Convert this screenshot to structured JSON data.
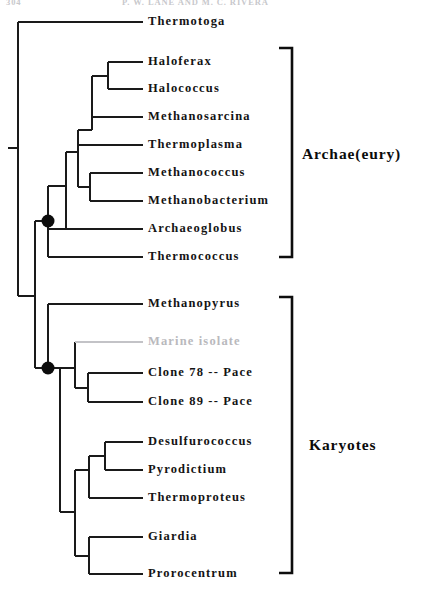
{
  "header": {
    "folio": "304",
    "running_head": "P. W. LANE AND M. C. RIVERA"
  },
  "figure": {
    "type": "phylogenetic-tree",
    "orientation": "left-to-right-cladogram",
    "line_color": "#1a1a1a",
    "text_color": "#141414",
    "faded_color": "#b9b9bd",
    "background": "#ffffff"
  },
  "groups": [
    {
      "id": "archae-eury",
      "label": "Archae(eury)",
      "bracket_top_y": 48,
      "bracket_bottom_y": 257,
      "members": [
        "Haloferax",
        "Halococcus",
        "Methanosarcina",
        "Thermoplasma",
        "Methanococcus",
        "Methanobacterium",
        "Archaeoglobus",
        "Thermococcus"
      ]
    },
    {
      "id": "karyotes",
      "label": "Karyotes",
      "bracket_top_y": 297,
      "bracket_bottom_y": 573,
      "members": [
        "Methanopyrus",
        "Marine isolate",
        "Clone 78 -- Pace",
        "Clone 89 -- Pace",
        "Desulfurococcus",
        "Pyrodictium",
        "Thermoproteus",
        "Giardia",
        "Prorocentrum"
      ]
    }
  ],
  "taxa": [
    {
      "id": "thermotoga",
      "label": "Thermotoga",
      "y": 22,
      "tip_x": 143,
      "faded": false,
      "group": null
    },
    {
      "id": "haloferax",
      "label": "Haloferax",
      "y": 62,
      "tip_x": 143,
      "faded": false,
      "group": "archae-eury"
    },
    {
      "id": "halococcus",
      "label": "Halococcus",
      "y": 89,
      "tip_x": 143,
      "faded": false,
      "group": "archae-eury"
    },
    {
      "id": "methanosarcina",
      "label": "Methanosarcina",
      "y": 117,
      "tip_x": 143,
      "faded": false,
      "group": "archae-eury"
    },
    {
      "id": "thermoplasma",
      "label": "Thermoplasma",
      "y": 145,
      "tip_x": 143,
      "faded": false,
      "group": "archae-eury"
    },
    {
      "id": "methanococcus",
      "label": "Methanococcus",
      "y": 173,
      "tip_x": 143,
      "faded": false,
      "group": "archae-eury"
    },
    {
      "id": "methanobacterium",
      "label": "Methanobacterium",
      "y": 201,
      "tip_x": 143,
      "faded": false,
      "group": "archae-eury"
    },
    {
      "id": "archaeoglobus",
      "label": "Archaeoglobus",
      "y": 229,
      "tip_x": 143,
      "faded": false,
      "group": "archae-eury"
    },
    {
      "id": "thermococcus",
      "label": "Thermococcus",
      "y": 257,
      "tip_x": 143,
      "faded": false,
      "group": "archae-eury"
    },
    {
      "id": "methanopyrus",
      "label": "Methanopyrus",
      "y": 304,
      "tip_x": 143,
      "faded": false,
      "group": "karyotes"
    },
    {
      "id": "marine-isolate",
      "label": "Marine  isolate",
      "y": 342,
      "tip_x": 143,
      "faded": true,
      "group": "karyotes"
    },
    {
      "id": "clone-78",
      "label": "Clone  78  --  Pace",
      "y": 373,
      "tip_x": 143,
      "faded": false,
      "group": "karyotes"
    },
    {
      "id": "clone-89",
      "label": "Clone  89  --  Pace",
      "y": 402,
      "tip_x": 143,
      "faded": false,
      "group": "karyotes"
    },
    {
      "id": "desulfurococcus",
      "label": "Desulfurococcus",
      "y": 442,
      "tip_x": 143,
      "faded": false,
      "group": "karyotes"
    },
    {
      "id": "pyrodictium",
      "label": "Pyrodictium",
      "y": 470,
      "tip_x": 143,
      "faded": false,
      "group": "karyotes"
    },
    {
      "id": "thermoproteus",
      "label": "Thermoproteus",
      "y": 498,
      "tip_x": 143,
      "faded": false,
      "group": "karyotes"
    },
    {
      "id": "giardia",
      "label": "Giardia",
      "y": 537,
      "tip_x": 143,
      "faded": false,
      "group": "karyotes"
    },
    {
      "id": "prorocentrum",
      "label": "Prorocentrum",
      "y": 574,
      "tip_x": 143,
      "faded": false,
      "group": "karyotes"
    }
  ],
  "support_nodes": [
    {
      "id": "archaea-node",
      "x": 48,
      "y": 221,
      "radius": 6.5,
      "filled": true
    },
    {
      "id": "karyotes-node",
      "x": 48,
      "y": 368,
      "radius": 6.5,
      "filled": true
    }
  ]
}
